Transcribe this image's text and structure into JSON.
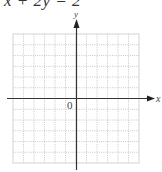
{
  "equation": "x + 2y = 2",
  "axes": {
    "x_label": "x",
    "y_label": "y",
    "origin_label": "0"
  },
  "grid": {
    "columns": 12,
    "rows": 12,
    "x_min": -6,
    "x_max": 6,
    "y_min": -6,
    "y_max": 6
  },
  "colors": {
    "axis": "#333333",
    "grid": "#bbbbbb",
    "text": "#444444"
  }
}
